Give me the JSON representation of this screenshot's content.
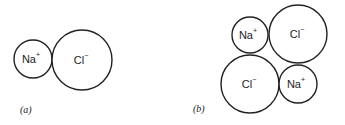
{
  "panels": [
    {
      "label": "(a)",
      "ions": [
        {
          "symbol": "Na",
          "charge": "+",
          "cx": 33,
          "cy": 59,
          "r": 19
        },
        {
          "symbol": "Cl",
          "charge": "−",
          "cx": 82,
          "cy": 60,
          "r": 30
        }
      ]
    },
    {
      "label": "(b)",
      "ions": [
        {
          "symbol": "Na",
          "charge": "+",
          "cx": 250,
          "cy": 35,
          "r": 18
        },
        {
          "symbol": "Cl",
          "charge": "−",
          "cx": 298,
          "cy": 34,
          "r": 29
        },
        {
          "symbol": "Cl",
          "charge": "−",
          "cx": 250,
          "cy": 84,
          "r": 29
        },
        {
          "symbol": "Na",
          "charge": "+",
          "cx": 298,
          "cy": 84,
          "r": 19
        }
      ]
    }
  ]
}
